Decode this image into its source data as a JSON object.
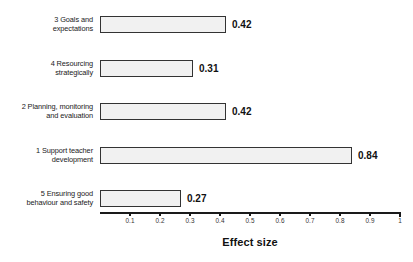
{
  "chart_data": {
    "type": "bar",
    "orientation": "horizontal",
    "title": "",
    "xlabel": "Effect size",
    "ylabel": "",
    "xlim": [
      0,
      1
    ],
    "grid": false,
    "legend": null,
    "tick_labels": [
      "0.1",
      "0.2",
      "0.3",
      "0.4",
      "0.5",
      "0.6",
      "0.7",
      "0.8",
      "0.9",
      "1"
    ],
    "tick_values": [
      0.1,
      0.2,
      0.3,
      0.4,
      0.5,
      0.6,
      0.7,
      0.8,
      0.9,
      1.0
    ],
    "categories": [
      "3 Goals and\nexpectations",
      "4 Resourcing\nstrategically",
      "2 Planning, monitoring\nand evaluation",
      "1 Support teacher\ndevelopment",
      "5 Ensuring good\nbehaviour and safety"
    ],
    "values": [
      0.42,
      0.31,
      0.42,
      0.84,
      0.27
    ],
    "value_labels": [
      "0.42",
      "0.31",
      "0.42",
      "0.84",
      "0.27"
    ],
    "bar_fill_color": "#f1f1f1",
    "bar_border_color": "#333333",
    "axis_color": "#1a1a1a"
  }
}
